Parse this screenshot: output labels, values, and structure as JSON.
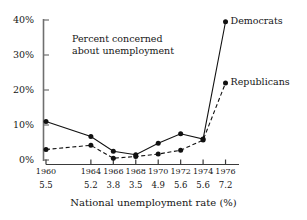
{
  "chart_data": {
    "type": "line",
    "title": "",
    "annotation": "Percent concerned\nabout unemployment",
    "annotation_line1": "Percent concerned",
    "annotation_line2": "about unemployment",
    "xlabel": "National unemployment rate (%)",
    "ylabel": "",
    "categories": [
      "1960",
      "1964",
      "1966",
      "1968",
      "1970",
      "1972",
      "1974",
      "1976"
    ],
    "secondary_categories": [
      "5.5",
      "5.2",
      "3.8",
      "3.5",
      "4.9",
      "5.6",
      "5.6",
      "7.2"
    ],
    "x_positions": [
      0,
      4,
      6,
      8,
      10,
      12,
      14,
      16
    ],
    "xlim": [
      -0.9,
      17.2
    ],
    "ylim": [
      0,
      43
    ],
    "ytick_values": [
      0,
      10,
      20,
      30,
      40
    ],
    "ytick_labels": [
      "0%",
      "10%",
      "20%",
      "30%",
      "40%"
    ],
    "grid": false,
    "legend_position": "right-inline",
    "series": [
      {
        "name": "Democrats",
        "style": "solid",
        "color": "#111111",
        "marker": "filled-circle",
        "values": [
          11.0,
          6.7,
          2.5,
          1.5,
          4.8,
          7.5,
          6.0,
          39.5
        ]
      },
      {
        "name": "Republicans",
        "style": "dashed",
        "color": "#111111",
        "marker": "filled-circle",
        "values": [
          3.0,
          4.2,
          0.5,
          1.0,
          1.7,
          2.8,
          5.7,
          22.0
        ]
      }
    ]
  },
  "axes": {
    "y_axis_name": "percent-concerned-axis",
    "x_axis_name": "national-unemployment-rate-axis"
  }
}
